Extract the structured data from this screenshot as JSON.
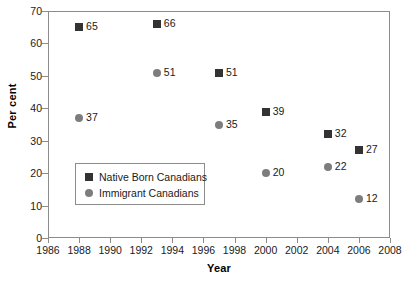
{
  "chart_data": {
    "type": "scatter",
    "title": "",
    "xlabel": "Year",
    "ylabel": "Per cent",
    "xlim": [
      1986,
      2008
    ],
    "ylim": [
      0,
      70
    ],
    "xticks": [
      1986,
      1988,
      1990,
      1992,
      1994,
      1996,
      1998,
      2000,
      2002,
      2004,
      2006,
      2008
    ],
    "yticks": [
      0,
      10,
      20,
      30,
      40,
      50,
      60,
      70
    ],
    "grid": false,
    "legend_position": "inside-lower-left",
    "series": [
      {
        "name": "Native Born Canadians",
        "marker": "square",
        "color": "#333333",
        "points": [
          {
            "x": 1988,
            "y": 65,
            "label": "65"
          },
          {
            "x": 1993,
            "y": 66,
            "label": "66"
          },
          {
            "x": 1997,
            "y": 51,
            "label": "51"
          },
          {
            "x": 2000,
            "y": 39,
            "label": "39"
          },
          {
            "x": 2004,
            "y": 32,
            "label": "32"
          },
          {
            "x": 2006,
            "y": 27,
            "label": "27"
          }
        ]
      },
      {
        "name": "Immigrant Canadians",
        "marker": "circle",
        "color": "#7d7d7d",
        "points": [
          {
            "x": 1988,
            "y": 37,
            "label": "37"
          },
          {
            "x": 1993,
            "y": 51,
            "label": "51"
          },
          {
            "x": 1997,
            "y": 35,
            "label": "35"
          },
          {
            "x": 2000,
            "y": 20,
            "label": "20"
          },
          {
            "x": 2004,
            "y": 22,
            "label": "22"
          },
          {
            "x": 2006,
            "y": 12,
            "label": "12"
          }
        ]
      }
    ]
  },
  "legend": {
    "entries": [
      {
        "label": "Native Born Canadians",
        "marker": "square"
      },
      {
        "label": "Immigrant Canadians",
        "marker": "circle"
      }
    ]
  },
  "colors": {
    "native_born": "#333333",
    "immigrant": "#7d7d7d",
    "axis": "#8c8c8c",
    "text": "#1a1a1a",
    "background": "#ffffff"
  }
}
